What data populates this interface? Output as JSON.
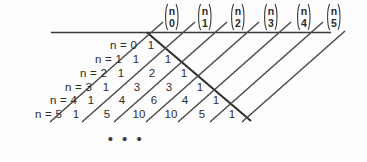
{
  "figure": {
    "background_color": "#fdfdfd",
    "line_color": "#3a3a3a",
    "text_color": "#2b2b2b",
    "ellipsis": "• • •"
  },
  "column_headers": [
    {
      "n": "n",
      "k": "0",
      "x": 172,
      "y": 2
    },
    {
      "n": "n",
      "k": "1",
      "x": 205,
      "y": 2
    },
    {
      "n": "n",
      "k": "2",
      "x": 238,
      "y": 2
    },
    {
      "n": "n",
      "k": "3",
      "x": 271,
      "y": 2
    },
    {
      "n": "n",
      "k": "4",
      "x": 304,
      "y": 2
    },
    {
      "n": "n",
      "k": "5",
      "x": 334,
      "y": 2
    }
  ],
  "row_labels": [
    {
      "label": "n = 0",
      "x": 137,
      "y": 45
    },
    {
      "label": "n = 1",
      "x": 122,
      "y": 59
    },
    {
      "label": "n = 2",
      "x": 107,
      "y": 73
    },
    {
      "label": "n = 3",
      "x": 92,
      "y": 87
    },
    {
      "label": "n = 4",
      "x": 77,
      "y": 100
    },
    {
      "label": "n = 5",
      "x": 62,
      "y": 114
    }
  ],
  "triangle_rows": [
    {
      "n": 0,
      "values": [
        "1"
      ]
    },
    {
      "n": 1,
      "values": [
        "1",
        "1"
      ]
    },
    {
      "n": 2,
      "values": [
        "1",
        "2",
        "1"
      ]
    },
    {
      "n": 3,
      "values": [
        "1",
        "3",
        "3",
        "1"
      ]
    },
    {
      "n": 4,
      "values": [
        "1",
        "4",
        "6",
        "4",
        "1"
      ]
    },
    {
      "n": 5,
      "values": [
        "1",
        "5",
        "10",
        "10",
        "5",
        "1"
      ]
    }
  ],
  "cells": [
    {
      "text": "1",
      "x": 151,
      "y": 45
    },
    {
      "text": "1",
      "x": 136,
      "y": 59
    },
    {
      "text": "1",
      "x": 168,
      "y": 59
    },
    {
      "text": "1",
      "x": 121,
      "y": 73
    },
    {
      "text": "2",
      "x": 152,
      "y": 73
    },
    {
      "text": "1",
      "x": 184,
      "y": 73
    },
    {
      "text": "1",
      "x": 106,
      "y": 87
    },
    {
      "text": "3",
      "x": 137,
      "y": 87
    },
    {
      "text": "3",
      "x": 169,
      "y": 87
    },
    {
      "text": "1",
      "x": 200,
      "y": 87
    },
    {
      "text": "1",
      "x": 91,
      "y": 100
    },
    {
      "text": "4",
      "x": 122,
      "y": 100
    },
    {
      "text": "6",
      "x": 154,
      "y": 100
    },
    {
      "text": "4",
      "x": 185,
      "y": 100
    },
    {
      "text": "1",
      "x": 216,
      "y": 100
    },
    {
      "text": "1",
      "x": 76,
      "y": 114
    },
    {
      "text": "5",
      "x": 107,
      "y": 114
    },
    {
      "text": "10",
      "x": 139,
      "y": 114
    },
    {
      "text": "10",
      "x": 171,
      "y": 114
    },
    {
      "text": "5",
      "x": 202,
      "y": 114
    },
    {
      "text": "1",
      "x": 232,
      "y": 114
    }
  ],
  "ellipsis_position": {
    "x": 126,
    "y": 138
  }
}
